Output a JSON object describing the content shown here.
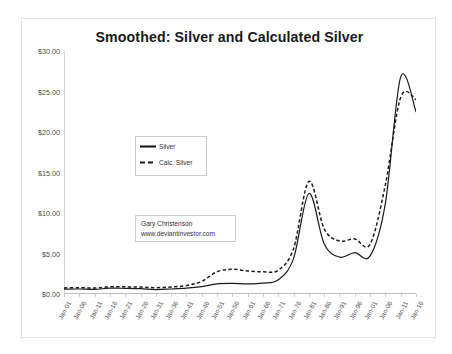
{
  "chart_data": {
    "type": "line",
    "title": "Smoothed:  Silver and Calculated Silver",
    "xlabel": "",
    "ylabel": "",
    "ylim": [
      0,
      30
    ],
    "ytick_labels": [
      "$0.00",
      "$5.00",
      "$10.00",
      "$15.00",
      "$20.00",
      "$25.00",
      "$30.00"
    ],
    "ytick_values": [
      0,
      5,
      10,
      15,
      20,
      25,
      30
    ],
    "grid": false,
    "legend_position": "upper-left-inset",
    "categories": [
      "Jan-01",
      "Jan-06",
      "Jan-11",
      "Jan-16",
      "Jan-21",
      "Jan-26",
      "Jan-31",
      "Jan-36",
      "Jan-41",
      "Jan-46",
      "Jan-51",
      "Jan-56",
      "Jan-61",
      "Jan-66",
      "Jan-71",
      "Jan-76",
      "Jan-81",
      "Jan-86",
      "Jan-91",
      "Jan-96",
      "Jan-01",
      "Jan-06",
      "Jan-11",
      "Jan-16"
    ],
    "x": [
      1901,
      1906,
      1911,
      1916,
      1921,
      1926,
      1931,
      1936,
      1941,
      1946,
      1951,
      1956,
      1961,
      1966,
      1971,
      1976,
      1981,
      1986,
      1991,
      1996,
      2001,
      2006,
      2011,
      2016
    ],
    "series": [
      {
        "name": "Silver",
        "style": "solid",
        "color": "#1a1a1a",
        "values": [
          0.6,
          0.62,
          0.58,
          0.72,
          0.7,
          0.66,
          0.55,
          0.62,
          0.72,
          0.92,
          1.25,
          1.3,
          1.25,
          1.35,
          1.75,
          4.4,
          12.4,
          6.2,
          4.55,
          5.1,
          4.7,
          11.2,
          26.8,
          22.5
        ]
      },
      {
        "name": "Calc. Silver",
        "style": "dashed",
        "color": "#1a1a1a",
        "values": [
          0.75,
          0.78,
          0.74,
          0.88,
          0.88,
          0.85,
          0.78,
          0.86,
          1.05,
          1.55,
          2.75,
          3.05,
          2.85,
          2.75,
          2.95,
          5.6,
          13.9,
          8.05,
          6.55,
          6.8,
          6.15,
          13.5,
          24.3,
          24.0
        ]
      }
    ],
    "annotations": [
      {
        "line1": "Gary Christenson",
        "line2": "www.deviantinvestor.com"
      }
    ]
  },
  "chart": {
    "title": "Smoothed:  Silver and Calculated Silver",
    "legend": {
      "items": [
        {
          "label": "Silver",
          "style": "solid"
        },
        {
          "label": "Calc. Silver",
          "style": "dashed"
        }
      ]
    },
    "annotation": {
      "author": "Gary Christenson",
      "website": "www.deviantinvestor.com"
    }
  }
}
